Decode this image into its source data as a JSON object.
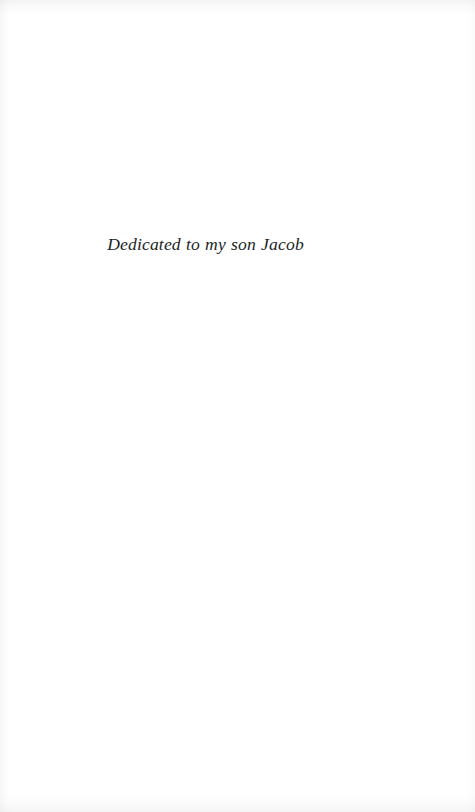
{
  "page": {
    "kind": "book-dedication-page",
    "background_color": "#ffffff",
    "text_color": "#211f1f"
  },
  "dedication": {
    "text": "Dedicated to my son Jacob"
  }
}
